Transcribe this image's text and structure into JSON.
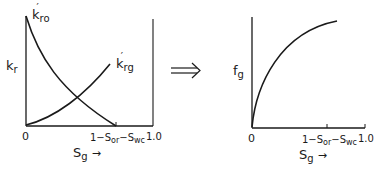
{
  "left_panel": {
    "y_label": "k",
    "y_label_sub": "r",
    "curves": [
      {
        "name": "k",
        "sub": "ro",
        "prime": "′",
        "description": "oil relative permeability, decreasing"
      },
      {
        "name": "k",
        "sub": "rg",
        "prime": "′",
        "description": "gas relative permeability, increasing"
      }
    ],
    "x_origin": "0",
    "x_tick_main": "1−S",
    "x_tick_sub1": "or",
    "x_tick_dash": "−S",
    "x_tick_sub2": "wc",
    "x_end": "1.0",
    "x_label": "S",
    "x_label_sub": "g",
    "x_arrow": "→"
  },
  "implies_arrow": "⟹",
  "right_panel": {
    "y_label": "f",
    "y_label_sub": "g",
    "curve": {
      "name": "fractional flow of gas",
      "shape": "concave increasing"
    },
    "x_origin": "0",
    "x_tick_main": "1−S",
    "x_tick_sub1": "or",
    "x_tick_dash": "−S",
    "x_tick_sub2": "wc",
    "x_end": "1.0",
    "x_label": "S",
    "x_label_sub": "g",
    "x_arrow": "→"
  },
  "colors": {
    "ink": "#1a1a1a",
    "background": "#ffffff"
  }
}
